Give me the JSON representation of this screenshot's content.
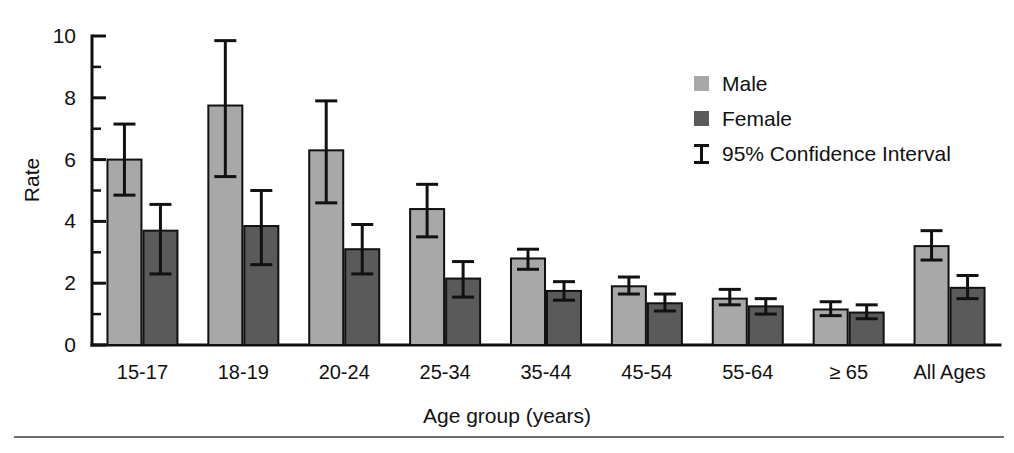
{
  "chart_data": {
    "type": "bar",
    "title": "",
    "xlabel": "Age group (years)",
    "ylabel": "Rate",
    "ylim": [
      0,
      10
    ],
    "ytick_labels": [
      "0",
      "2",
      "4",
      "6",
      "8",
      "10"
    ],
    "ytick_values": [
      0,
      2,
      4,
      6,
      8,
      10
    ],
    "yminor_values": [
      1,
      3,
      5,
      7,
      9
    ],
    "grid": false,
    "legend_position": "top-right",
    "categories": [
      "15-17",
      "18-19",
      "20-24",
      "25-34",
      "35-44",
      "45-54",
      "55-64",
      "≥ 65",
      "All Ages"
    ],
    "series": [
      {
        "name": "Male",
        "color": "#a8a8a8",
        "values": [
          6.0,
          7.75,
          6.3,
          4.4,
          2.8,
          1.9,
          1.5,
          1.15,
          3.2
        ],
        "ci_low": [
          4.85,
          5.45,
          4.6,
          3.5,
          2.45,
          1.65,
          1.3,
          0.95,
          2.75
        ],
        "ci_high": [
          7.15,
          9.85,
          7.9,
          5.2,
          3.1,
          2.2,
          1.8,
          1.4,
          3.7
        ]
      },
      {
        "name": "Female",
        "color": "#5a5a5a",
        "values": [
          3.7,
          3.85,
          3.1,
          2.15,
          1.75,
          1.35,
          1.25,
          1.05,
          1.85
        ],
        "ci_low": [
          2.3,
          2.6,
          2.3,
          1.55,
          1.45,
          1.1,
          1.0,
          0.85,
          1.5
        ],
        "ci_high": [
          4.55,
          5.0,
          3.9,
          2.7,
          2.05,
          1.65,
          1.5,
          1.3,
          2.25
        ]
      }
    ],
    "error_marker": "95% Confidence Interval"
  },
  "legend": {
    "items": [
      {
        "label": "Male",
        "marker": "swatch",
        "color": "#a8a8a8"
      },
      {
        "label": "Female",
        "marker": "swatch",
        "color": "#5a5a5a"
      },
      {
        "label": "95% Confidence Interval",
        "marker": "ibeam",
        "color": "#111111"
      }
    ]
  },
  "axes": {
    "y_title": "Rate",
    "x_title": "Age group (years)"
  }
}
